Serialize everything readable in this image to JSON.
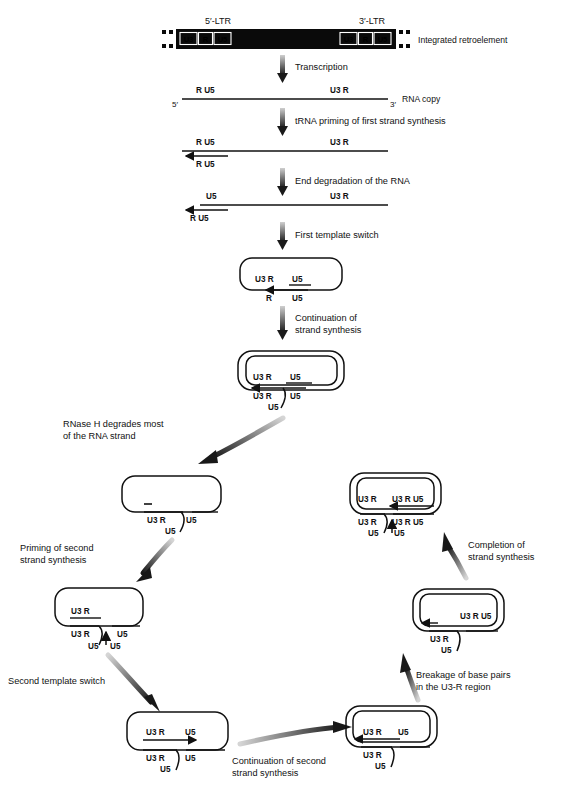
{
  "figure": {
    "title_hidden": "Reverse transcription of a retroelement",
    "type": "process-diagram"
  },
  "top": {
    "ltr5_label": "5′-LTR",
    "ltr3_label": "3′-LTR",
    "caption": "Integrated retroelement",
    "ltr_boxes": [
      "U3",
      "R",
      "U5"
    ]
  },
  "steps": [
    {
      "id": "transcription",
      "label": "Transcription"
    },
    {
      "id": "trna-priming",
      "label": "tRNA priming of first strand synthesis"
    },
    {
      "id": "end-degradation",
      "label": "End degradation of the RNA"
    },
    {
      "id": "first-template-switch",
      "label": "First template switch"
    },
    {
      "id": "continuation-strand-synthesis",
      "label": "Continuation of\nstrand synthesis",
      "line1": "Continuation of",
      "line2": "strand synthesis"
    },
    {
      "id": "rnase-h",
      "label": "RNase H degrades most\nof the RNA strand",
      "line1": "RNase H degrades most",
      "line2": "of the RNA strand"
    },
    {
      "id": "priming-second-strand",
      "label": "Priming of second\nstrand synthesis",
      "line1": "Priming of second",
      "line2": "strand synthesis"
    },
    {
      "id": "second-template-switch",
      "label": "Second template switch"
    },
    {
      "id": "continuation-second-strand",
      "label": "Continuation of second\nstrand synthesis",
      "line1": "Continuation of second",
      "line2": "strand synthesis"
    },
    {
      "id": "breakage-base-pairs",
      "label": "Breakage of base pairs\nin the U3-R region",
      "line1": "Breakage of base pairs",
      "line2": "in the U3-R region"
    },
    {
      "id": "completion-strand-synthesis",
      "label": "Completion of\nstrand synthesis",
      "line1": "Completion of",
      "line2": "strand synthesis"
    }
  ],
  "stage_rna_copy": {
    "caption": "RNA copy",
    "five_prime": "5′",
    "three_prime": "3′",
    "left_labels": "R  U5",
    "right_labels": "U3  R"
  },
  "stage_trna_priming": {
    "top_left": "R  U5",
    "top_right": "U3  R",
    "bottom_left": "R  U5"
  },
  "stage_end_degradation": {
    "top_left": "U5",
    "top_right": "U3  R",
    "bottom_left": "R  U5"
  },
  "stage_first_switch": {
    "inner_left": "U3 R",
    "inner_right": "U5",
    "outer_left": "R",
    "outer_right": "U5"
  },
  "stage_continuation1": {
    "inner_left": "U3 R",
    "inner_right": "U5",
    "outer_left": "U3 R",
    "outer_right": "U5",
    "tail": "U5"
  },
  "stage_rnase_product": {
    "outer_left": "U3 R",
    "outer_right": "U5",
    "tail": "U5"
  },
  "stage_priming_second": {
    "inner_left": "U3 R",
    "outer_left": "U3 R",
    "outer_right": "U5",
    "tail_left": "U5",
    "tail_right": "U5"
  },
  "stage_second_switch": {
    "inner_left": "U3 R",
    "inner_right": "U5",
    "outer_left": "U3 R",
    "outer_right": "U5",
    "tail": "U5"
  },
  "stage_cont_second": {
    "inner_left": "U3 R",
    "inner_right": "U5",
    "outer_left": "U3 R",
    "tail": "U5"
  },
  "stage_breakage": {
    "inner_right": "U3  R  U5",
    "outer_left": "U3 R",
    "tail": "U5"
  },
  "stage_completion": {
    "inner_left": "U3 R",
    "inner_right": "U3  R  U5",
    "outer_left": "U3 R",
    "outer_right": "U3  R  U5",
    "tail_left": "U5",
    "tail_right": "U5"
  },
  "colors": {
    "ink": "#111111",
    "bar": "#0a0a0a",
    "arrow_gradient_light": "#cfcfcf",
    "arrow_gradient_dark": "#1a1a1a",
    "background": "#ffffff"
  }
}
